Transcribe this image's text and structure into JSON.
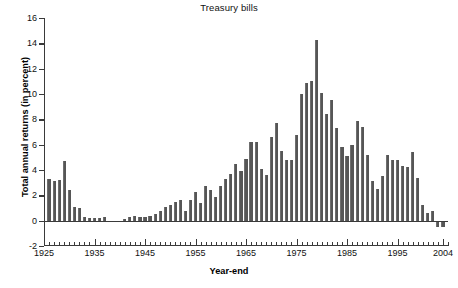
{
  "chart_data": {
    "type": "bar",
    "title": "Treasury bills",
    "xlabel": "Year-end",
    "ylabel": "Total annual returns (in percent)",
    "ylim": [
      -2,
      16
    ],
    "ytick_values": [
      -2,
      0,
      2,
      4,
      6,
      8,
      10,
      12,
      14,
      16
    ],
    "ytick_labels": [
      "-2",
      "0",
      "2",
      "4",
      "6",
      "8",
      "10",
      "12",
      "14",
      "16"
    ],
    "xlim": [
      1925,
      2005
    ],
    "xtick_labels": [
      "1925",
      "1935",
      "1945",
      "1955",
      "1965",
      "1975",
      "1985",
      "1995",
      "2004"
    ],
    "xtick_values": [
      1925,
      1935,
      1945,
      1955,
      1965,
      1975,
      1985,
      1995,
      2004
    ],
    "grid": false,
    "legend": null,
    "bar_color": "#565656",
    "axis_color": "#3a3a3a",
    "categories": [
      1926,
      1927,
      1928,
      1929,
      1930,
      1931,
      1932,
      1933,
      1934,
      1935,
      1936,
      1937,
      1938,
      1939,
      1940,
      1941,
      1942,
      1943,
      1944,
      1945,
      1946,
      1947,
      1948,
      1949,
      1950,
      1951,
      1952,
      1953,
      1954,
      1955,
      1956,
      1957,
      1958,
      1959,
      1960,
      1961,
      1962,
      1963,
      1964,
      1965,
      1966,
      1967,
      1968,
      1969,
      1970,
      1971,
      1972,
      1973,
      1974,
      1975,
      1976,
      1977,
      1978,
      1979,
      1980,
      1981,
      1982,
      1983,
      1984,
      1985,
      1986,
      1987,
      1988,
      1989,
      1990,
      1991,
      1992,
      1993,
      1994,
      1995,
      1996,
      1997,
      1998,
      1999,
      2000,
      2001,
      2002,
      2003,
      2004
    ],
    "values": [
      3.3,
      3.1,
      3.2,
      4.7,
      2.4,
      1.1,
      1.0,
      0.3,
      0.2,
      0.2,
      0.2,
      0.3,
      0.0,
      0.0,
      0.0,
      0.1,
      0.3,
      0.4,
      0.3,
      0.3,
      0.4,
      0.5,
      0.8,
      1.1,
      1.2,
      1.5,
      1.6,
      0.8,
      1.6,
      2.3,
      1.4,
      2.7,
      2.4,
      1.9,
      2.7,
      3.3,
      3.7,
      4.5,
      3.9,
      4.9,
      6.2,
      6.2,
      4.1,
      3.6,
      6.6,
      7.7,
      5.5,
      4.8,
      4.8,
      6.8,
      10.0,
      10.9,
      11.0,
      14.3,
      10.1,
      8.4,
      9.5,
      7.3,
      5.8,
      5.1,
      6.0,
      7.9,
      7.4,
      5.2,
      3.1,
      2.5,
      3.5,
      5.2,
      4.8,
      4.8,
      4.3,
      4.2,
      5.4,
      3.4,
      1.2,
      0.6,
      0.8,
      -0.5,
      -0.5
    ]
  }
}
